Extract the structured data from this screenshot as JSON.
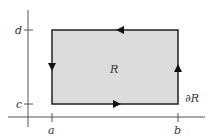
{
  "diagram": {
    "type": "region-boundary-orientation",
    "region_label": "R",
    "boundary_label": "∂R",
    "x_ticks": [
      {
        "label": "a",
        "x": 52
      },
      {
        "label": "b",
        "x": 178
      }
    ],
    "y_ticks": [
      {
        "label": "d",
        "y": 30
      },
      {
        "label": "c",
        "y": 104
      }
    ],
    "rectangle": {
      "x1": 52,
      "y1": 30,
      "x2": 178,
      "y2": 104
    },
    "axes": {
      "origin_x": 28,
      "origin_y": 117
    },
    "arrows": [
      {
        "edge": "top",
        "direction": "left"
      },
      {
        "edge": "left",
        "direction": "down"
      },
      {
        "edge": "bottom",
        "direction": "right"
      },
      {
        "edge": "right",
        "direction": "up"
      }
    ],
    "colors": {
      "fill": "#dcdcdc",
      "stroke": "#222222",
      "axis": "#555555"
    }
  }
}
